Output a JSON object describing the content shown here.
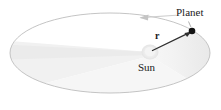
{
  "figure": {
    "caption": "",
    "labels": {
      "planet": "Planet",
      "sun": "Sun",
      "radius_vector": "r"
    },
    "colors": {
      "background": "#ffffff",
      "orbit_stroke": "#b9b9b9",
      "swept_area_fill": "#e9e9e9",
      "swept_area_fill_light": "#f2f2f2",
      "sun_fill": "#efefef",
      "planet_fill": "#111111",
      "vector_stroke": "#2b2b2b",
      "motion_arrow_stroke": "#cccccc",
      "label_text": "#1a1a1a"
    },
    "geometry": {
      "ellipse_center_x": 110,
      "ellipse_center_y": 53,
      "ellipse_radius_x": 100,
      "ellipse_radius_y": 40,
      "sun_x": 150,
      "sun_y": 52,
      "sun_radius": 7,
      "planet_x": 192,
      "planet_y": 31,
      "planet_radius": 3.2,
      "vector_start_x": 153,
      "vector_start_y": 51,
      "vector_end_x": 189,
      "vector_end_y": 33,
      "motion_arrow_x": 152,
      "motion_arrow_y": 17,
      "motion_direction": "counterclockwise"
    }
  }
}
